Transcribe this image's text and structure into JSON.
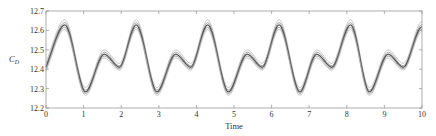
{
  "chart_data": {
    "type": "line",
    "title": "",
    "xlabel": "Time",
    "ylabel": "C_D",
    "xlim": [
      0,
      10
    ],
    "ylim": [
      12.2,
      12.7
    ],
    "xticks": [
      "0",
      "1",
      "2",
      "3",
      "4",
      "5",
      "6",
      "7",
      "8",
      "9",
      "10"
    ],
    "yticks": [
      "12.2",
      "12.3",
      "12.4",
      "12.5",
      "12.6",
      "12.7"
    ],
    "grid": false,
    "legend": null,
    "series": [
      {
        "name": "upper-bound",
        "color": "#b8b8b8",
        "offset": 0.025,
        "x": [
          0,
          0.5,
          1.05,
          1.55,
          1.95,
          2.4,
          2.95,
          3.45,
          3.85,
          4.3,
          4.85,
          5.35,
          5.75,
          6.2,
          6.75,
          7.2,
          7.6,
          8.1,
          8.6,
          9.1,
          9.5,
          10.0
        ],
        "values": [
          12.435,
          12.655,
          12.305,
          12.5,
          12.43,
          12.655,
          12.305,
          12.5,
          12.43,
          12.655,
          12.305,
          12.5,
          12.43,
          12.655,
          12.305,
          12.5,
          12.43,
          12.655,
          12.305,
          12.5,
          12.43,
          12.645
        ]
      },
      {
        "name": "upper-mid",
        "color": "#8a8a8a",
        "x": [
          0,
          0.5,
          1.05,
          1.55,
          1.95,
          2.4,
          2.95,
          3.45,
          3.85,
          4.3,
          4.85,
          5.35,
          5.75,
          6.2,
          6.75,
          7.2,
          7.6,
          8.1,
          8.6,
          9.1,
          9.5,
          10.0
        ],
        "values": [
          12.42,
          12.64,
          12.292,
          12.488,
          12.418,
          12.64,
          12.292,
          12.488,
          12.418,
          12.64,
          12.292,
          12.488,
          12.418,
          12.64,
          12.292,
          12.488,
          12.418,
          12.64,
          12.292,
          12.488,
          12.418,
          12.63
        ]
      },
      {
        "name": "mean",
        "color": "#555555",
        "x": [
          0,
          0.5,
          1.05,
          1.55,
          1.95,
          2.4,
          2.95,
          3.45,
          3.85,
          4.3,
          4.85,
          5.35,
          5.75,
          6.2,
          6.75,
          7.2,
          7.6,
          8.1,
          8.6,
          9.1,
          9.5,
          10.0
        ],
        "values": [
          12.41,
          12.628,
          12.283,
          12.478,
          12.41,
          12.628,
          12.283,
          12.478,
          12.41,
          12.628,
          12.283,
          12.478,
          12.41,
          12.628,
          12.283,
          12.478,
          12.41,
          12.628,
          12.283,
          12.478,
          12.41,
          12.618
        ]
      },
      {
        "name": "lower-mid",
        "color": "#8a8a8a",
        "x": [
          0,
          0.5,
          1.05,
          1.55,
          1.95,
          2.4,
          2.95,
          3.45,
          3.85,
          4.3,
          4.85,
          5.35,
          5.75,
          6.2,
          6.75,
          7.2,
          7.6,
          8.1,
          8.6,
          9.1,
          9.5,
          10.0
        ],
        "values": [
          12.4,
          12.616,
          12.274,
          12.468,
          12.402,
          12.616,
          12.274,
          12.468,
          12.402,
          12.616,
          12.274,
          12.468,
          12.402,
          12.616,
          12.274,
          12.468,
          12.402,
          12.616,
          12.274,
          12.468,
          12.402,
          12.606
        ]
      },
      {
        "name": "lower-bound",
        "color": "#b8b8b8",
        "x": [
          0,
          0.5,
          1.05,
          1.55,
          1.95,
          2.4,
          2.95,
          3.45,
          3.85,
          4.3,
          4.85,
          5.35,
          5.75,
          6.2,
          6.75,
          7.2,
          7.6,
          8.1,
          8.6,
          9.1,
          9.5,
          10.0
        ],
        "values": [
          12.39,
          12.605,
          12.265,
          12.458,
          12.395,
          12.605,
          12.265,
          12.458,
          12.395,
          12.605,
          12.265,
          12.458,
          12.395,
          12.605,
          12.265,
          12.458,
          12.395,
          12.605,
          12.265,
          12.458,
          12.395,
          12.595
        ]
      }
    ]
  }
}
